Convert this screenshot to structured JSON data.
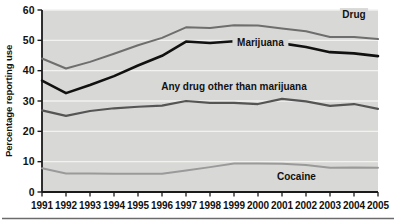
{
  "chart_data": {
    "type": "line",
    "title": "",
    "xlabel": "",
    "ylabel": "Percentage reporting use",
    "ylim": [
      0,
      60
    ],
    "ytick_values": [
      0,
      10,
      20,
      30,
      40,
      50,
      60
    ],
    "ytick_labels": [
      "0",
      "10",
      "20",
      "30",
      "40",
      "50",
      "60"
    ],
    "grid": true,
    "legend_position": "inline-on-lines",
    "x": [
      1991,
      1992,
      1993,
      1994,
      1995,
      1996,
      1997,
      1998,
      1999,
      2000,
      2001,
      2002,
      2003,
      2004,
      2005
    ],
    "categories": [
      "1991",
      "1992",
      "1993",
      "1994",
      "1995",
      "1996",
      "1997",
      "1998",
      "1999",
      "2000",
      "2001",
      "2002",
      "2003",
      "2004",
      "2005"
    ],
    "series": [
      {
        "name": "Drug",
        "color": "#6e6e6e",
        "width": 2,
        "label": "Drug",
        "label_x": 2004.0,
        "label_y": 57.5,
        "values": [
          44,
          40.7,
          42.9,
          45.6,
          48.4,
          50.8,
          54.3,
          54.1,
          55.0,
          54.9,
          53.9,
          53.0,
          51.1,
          51.1,
          50.4
        ]
      },
      {
        "name": "Marijuana",
        "color": "#111111",
        "width": 2.6,
        "label": "Marijuana",
        "label_x": 2000.1,
        "label_y": 48.2,
        "values": [
          36.7,
          32.6,
          35.3,
          38.2,
          41.7,
          44.9,
          49.6,
          49.1,
          49.7,
          48.8,
          49.0,
          47.8,
          46.1,
          45.7,
          44.8
        ]
      },
      {
        "name": "Any drug other than marijuana",
        "color": "#555555",
        "width": 2.2,
        "label": "Any drug other than marijuana",
        "label_x": 1999.0,
        "label_y": 33.5,
        "values": [
          26.9,
          25.1,
          26.7,
          27.6,
          28.1,
          28.5,
          30.0,
          29.4,
          29.4,
          29.0,
          30.7,
          29.9,
          28.4,
          29.0,
          27.4
        ]
      },
      {
        "name": "Cocaine",
        "color": "#9a9a9a",
        "width": 2,
        "label": "Cocaine",
        "label_x": 2001.6,
        "label_y": 4.1,
        "values": [
          7.8,
          6.1,
          6.1,
          6.0,
          6.0,
          6.0,
          7.1,
          8.2,
          9.4,
          9.4,
          9.3,
          8.9,
          8.0,
          8.1,
          8.0
        ]
      }
    ],
    "colors": {
      "plot_background": "#d8d8d6",
      "gridline": "#f2f2f0",
      "axis": "#1a1a1a",
      "page_background": "#ffffff",
      "rule": "#6b6b6b"
    }
  }
}
